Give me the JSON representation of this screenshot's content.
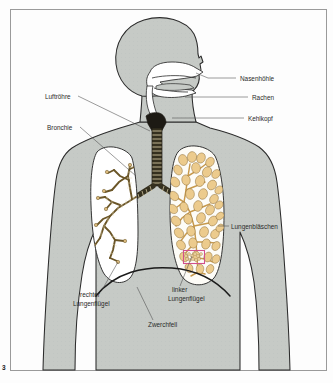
{
  "figure": {
    "number": "3",
    "border_color": "#9a9a9a",
    "background_color": "#fdfdfd"
  },
  "colors": {
    "body_fill": "#c6cac6",
    "body_outline": "#2b2b2b",
    "lung_left_fill": "#ffffff",
    "lung_right_fill": "#fdfcf7",
    "alveoli_fill": "#eccb8d",
    "alveoli_outline": "#8a6a33",
    "bronchus_fill": "#d8b77a",
    "bronchus_outline": "#5e4a22",
    "trachea_fill": "#1d1a14",
    "diaphragm": "#1a1a1a",
    "highlight_box": "#d2518c",
    "leader_line": "#4a4a4a",
    "label_text": "#2a2a2a"
  },
  "labels": [
    {
      "id": "nasenhoehle",
      "text": "Nasenhöhle",
      "side": "right",
      "text_x": 240,
      "text_y": 80,
      "leader": "M236,78 L206,78 L196,73"
    },
    {
      "id": "rachen",
      "text": "Rachen",
      "side": "right",
      "text_x": 252,
      "text_y": 99,
      "leader": "M248,97 L185,97"
    },
    {
      "id": "kehlkopf",
      "text": "Kehlkopf",
      "side": "right",
      "text_x": 248,
      "text_y": 120,
      "leader": "M244,118 L176,118"
    },
    {
      "id": "lungenblaeschen",
      "text": "Lungenbläschen",
      "side": "right",
      "text_x": 230,
      "text_y": 228,
      "leader": "M228,226 L219,226"
    },
    {
      "id": "luftroehre",
      "text": "Luftröhre",
      "side": "left",
      "text_x": 45,
      "text_y": 98,
      "leader": "M78,96 L150,131"
    },
    {
      "id": "bronchie",
      "text": "Bronchie",
      "side": "left",
      "text_x": 48,
      "text_y": 128,
      "leader": "M80,127 L136,175"
    },
    {
      "id": "rechter-lungenfluegel",
      "text": "rechter",
      "text2": "Lungenflügel",
      "side": "left",
      "text_x": 80,
      "text_y": 297,
      "leader": "M102,290 L118,265"
    },
    {
      "id": "linker-lungenfluegel",
      "text": "linker",
      "text2": "Lungenflügel",
      "side": "right",
      "text_x": 168,
      "text_y": 292,
      "leader": "M178,286 L190,258"
    },
    {
      "id": "zwerchfell",
      "text": "Zwerchfell",
      "side": "center",
      "text_x": 148,
      "text_y": 327,
      "leader": "M152,320 L136,288"
    }
  ],
  "anatomy": {
    "parts": [
      "Nasenhöhle",
      "Rachen",
      "Kehlkopf",
      "Luftröhre",
      "Bronchie",
      "Lungenbläschen",
      "rechter Lungenflügel",
      "linker Lungenflügel",
      "Zwerchfell"
    ]
  }
}
